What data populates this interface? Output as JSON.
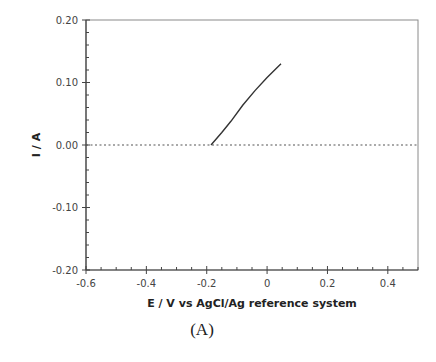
{
  "chart_data": {
    "type": "line",
    "title": "",
    "caption": "(A)",
    "xlabel": "E / V vs AgCl/Ag reference system",
    "ylabel": "I / A",
    "xlim": [
      -0.6,
      0.5
    ],
    "ylim": [
      -0.2,
      0.2
    ],
    "xticks": [
      -0.6,
      -0.4,
      -0.2,
      0,
      0.2,
      0.4
    ],
    "xtick_labels": [
      "-0.6",
      "-0.4",
      "-0.2",
      "0",
      "0.2",
      "0.4"
    ],
    "yticks": [
      0.2,
      0.1,
      0.0,
      -0.1,
      -0.2
    ],
    "ytick_labels": [
      "0.20",
      "0.10",
      "0.00",
      "-0.10",
      "-0.20"
    ],
    "grid": false,
    "legend": null,
    "reference_line": {
      "y": 0.0,
      "style": "dotted",
      "color": "#555555"
    },
    "series": [
      {
        "name": "I-E curve",
        "color": "#333333",
        "x": [
          -0.186,
          -0.15,
          -0.12,
          -0.08,
          -0.04,
          0.0,
          0.046
        ],
        "y": [
          0.0,
          0.02,
          0.038,
          0.064,
          0.087,
          0.108,
          0.13
        ]
      }
    ]
  }
}
